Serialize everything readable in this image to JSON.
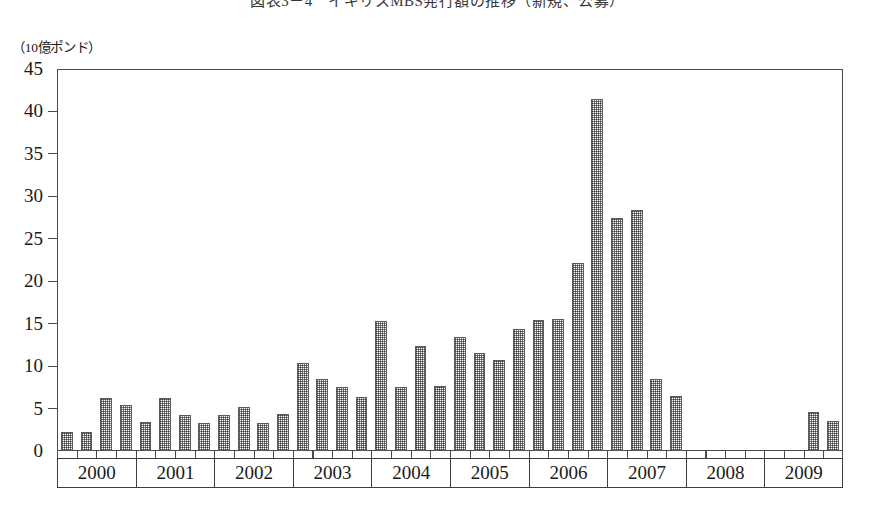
{
  "figure": {
    "title": "図表3－4　イギリスMBS発行額の推移（新規、公募）",
    "y_axis_unit": "（10億ポンド）"
  },
  "chart_data": {
    "type": "bar",
    "title": "図表3－4　イギリスMBS発行額の推移（新規、公募）",
    "xlabel": "",
    "ylabel": "（10億ポンド）",
    "ylim": [
      0,
      45
    ],
    "ytick_labels": [
      "45",
      "40",
      "35",
      "30",
      "25",
      "20",
      "15",
      "10",
      "5",
      "0"
    ],
    "yticks": [
      45,
      40,
      35,
      30,
      25,
      20,
      15,
      10,
      5,
      0
    ],
    "grid": false,
    "legend": "none",
    "year_groups": [
      "2000",
      "2001",
      "2002",
      "2003",
      "2004",
      "2005",
      "2006",
      "2007",
      "2008",
      "2009"
    ],
    "quarters_per_year": 4,
    "categories": [
      "2000Q1",
      "2000Q2",
      "2000Q3",
      "2000Q4",
      "2001Q1",
      "2001Q2",
      "2001Q3",
      "2001Q4",
      "2002Q1",
      "2002Q2",
      "2002Q3",
      "2002Q4",
      "2003Q1",
      "2003Q2",
      "2003Q3",
      "2003Q4",
      "2004Q1",
      "2004Q2",
      "2004Q3",
      "2004Q4",
      "2005Q1",
      "2005Q2",
      "2005Q3",
      "2005Q4",
      "2006Q1",
      "2006Q2",
      "2006Q3",
      "2006Q4",
      "2007Q1",
      "2007Q2",
      "2007Q3",
      "2007Q4",
      "2008Q1",
      "2008Q2",
      "2008Q3",
      "2008Q4",
      "2009Q1",
      "2009Q2",
      "2009Q3",
      "2009Q4"
    ],
    "values": [
      2.2,
      2.2,
      6.2,
      5.4,
      3.4,
      6.2,
      4.3,
      3.3,
      4.2,
      5.2,
      3.3,
      4.4,
      10.4,
      8.5,
      7.5,
      6.4,
      15.3,
      7.6,
      12.4,
      7.7,
      13.4,
      11.5,
      10.7,
      14.4,
      15.4,
      15.6,
      22.2,
      41.5,
      27.4,
      28.4,
      8.5,
      6.5,
      0,
      0,
      0,
      0,
      0,
      0,
      4.6,
      3.5
    ],
    "series_name": "イギリスMBS発行額",
    "bar_color": "#7d7d7d",
    "bar_edge_color": "#5a5a5a",
    "background_color": "#ffffff"
  }
}
